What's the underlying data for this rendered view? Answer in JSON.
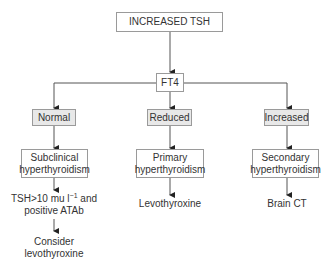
{
  "diagram": {
    "root": {
      "label": "INCREASED TSH"
    },
    "test": {
      "label": "FT4"
    },
    "branches": [
      {
        "result": "Normal",
        "diagnosis_line1": "Subclinical",
        "diagnosis_line2": "hyperthyroidism",
        "action_line1": "TSH>10 mu l",
        "action_sup": "−1",
        "action_line1_suffix": " and",
        "action_line2": "positive ATAb",
        "final_line1": "Consider",
        "final_line2": "levothyroxine"
      },
      {
        "result": "Reduced",
        "diagnosis_line1": "Primary",
        "diagnosis_line2": "hyperthyroidism",
        "action": "Levothyroxine"
      },
      {
        "result": "Increased",
        "diagnosis_line1": "Secondary",
        "diagnosis_line2": "hyperthyroidism",
        "action": "Brain CT"
      }
    ]
  },
  "colors": {
    "line": "#555555",
    "box_border": "#9a9a9a",
    "shaded_fill": "#e8e8e8",
    "text": "#333333"
  }
}
